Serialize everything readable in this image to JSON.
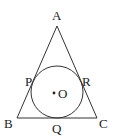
{
  "diagram": {
    "type": "triangle-with-incircle",
    "vertices": [
      {
        "name": "A",
        "x": 57,
        "y": 26
      },
      {
        "name": "B",
        "x": 17,
        "y": 118
      },
      {
        "name": "C",
        "x": 97,
        "y": 118
      }
    ],
    "tangent_points": [
      {
        "name": "P",
        "side": "AB"
      },
      {
        "name": "Q",
        "side": "BC"
      },
      {
        "name": "R",
        "side": "AC"
      }
    ],
    "circle": {
      "center": "O",
      "cx": 56,
      "cy": 92,
      "r": 26
    },
    "labels": {
      "A": "A",
      "B": "B",
      "C": "C",
      "P": "P",
      "Q": "Q",
      "R": "R",
      "O": "O"
    },
    "colors": {
      "stroke": "#333333",
      "background": "#ffffff"
    }
  }
}
